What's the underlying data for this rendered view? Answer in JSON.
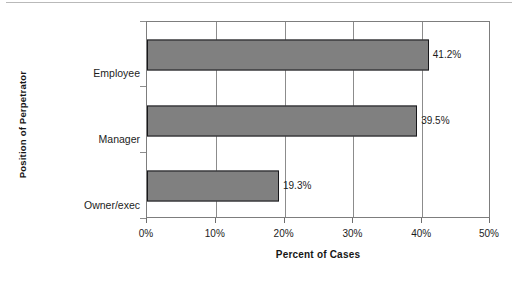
{
  "chart_data": {
    "type": "bar",
    "orientation": "horizontal",
    "title": "",
    "xlabel": "Percent of Cases",
    "ylabel": "Position of Perpetrator",
    "categories": [
      "Employee",
      "Manager",
      "Owner/exec"
    ],
    "values": [
      41.2,
      39.5,
      19.3
    ],
    "data_labels": [
      "41.2%",
      "39.5%",
      "19.3%"
    ],
    "xlim": [
      0,
      50
    ],
    "xticks": [
      0,
      10,
      20,
      30,
      40,
      50
    ],
    "xtick_labels": [
      "0%",
      "10%",
      "20%",
      "30%",
      "40%",
      "50%"
    ],
    "grid": "vertical",
    "legend": "none",
    "series": [
      {
        "name": "Percent of Cases",
        "values": [
          41.2,
          39.5,
          19.3
        ]
      }
    ],
    "colors": {
      "bar_fill": "#808080",
      "bar_edge": "#17171a",
      "plot_border": "#7d7d7d",
      "gridline": "#8c8c8c",
      "background": "#ffffff",
      "text": "#1c1c1c"
    }
  }
}
